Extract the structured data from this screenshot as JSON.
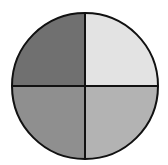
{
  "diagram": {
    "type": "circle-quadrants",
    "center": {
      "x": 85,
      "y": 86
    },
    "radius": 73,
    "outline_color": "#111111",
    "divider_color": "#111111",
    "quadrants": [
      {
        "id": "top-left",
        "color": "#707070"
      },
      {
        "id": "top-right",
        "color": "#e3e3e3"
      },
      {
        "id": "bottom-left",
        "color": "#8f8f8f"
      },
      {
        "id": "bottom-right",
        "color": "#b3b3b3"
      }
    ]
  }
}
